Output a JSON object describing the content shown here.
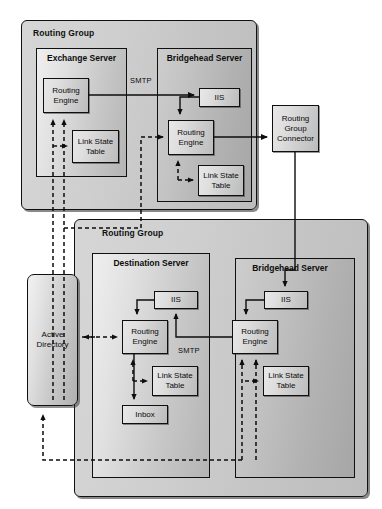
{
  "diagram": {
    "type": "network-architecture",
    "groups": [
      {
        "id": "routing-group-top",
        "label": "Routing Group",
        "servers": [
          {
            "id": "exchange-server",
            "label_line1": "Exchange",
            "label_line2": "Server",
            "components": [
              {
                "id": "ex-routing-engine",
                "label_line1": "Routing",
                "label_line2": "Engine"
              },
              {
                "id": "ex-link-state-table",
                "label_line1": "Link State",
                "label_line2": "Table"
              }
            ]
          },
          {
            "id": "bridgehead-server-top",
            "label_line1": "Bridgehead",
            "label_line2": "Server",
            "components": [
              {
                "id": "bh-top-iis",
                "label_line1": "IIS",
                "label_line2": ""
              },
              {
                "id": "bh-top-routing-engine",
                "label_line1": "Routing",
                "label_line2": "Engine"
              },
              {
                "id": "bh-top-link-state-table",
                "label_line1": "Link State",
                "label_line2": "Table"
              }
            ]
          }
        ]
      },
      {
        "id": "routing-group-bottom",
        "label": "Routing Group",
        "servers": [
          {
            "id": "destination-server",
            "label_line1": "Destination",
            "label_line2": "Server",
            "components": [
              {
                "id": "dest-iis",
                "label_line1": "IIS",
                "label_line2": ""
              },
              {
                "id": "dest-routing-engine",
                "label_line1": "Routing",
                "label_line2": "Engine"
              },
              {
                "id": "dest-link-state-table",
                "label_line1": "Link State",
                "label_line2": "Table"
              },
              {
                "id": "dest-inbox",
                "label_line1": "Inbox",
                "label_line2": ""
              }
            ]
          },
          {
            "id": "bridgehead-server-bottom",
            "label_line1": "Bridgehead",
            "label_line2": "Server",
            "components": [
              {
                "id": "bh-bot-iis",
                "label_line1": "IIS",
                "label_line2": ""
              },
              {
                "id": "bh-bot-routing-engine",
                "label_line1": "Routing",
                "label_line2": "Engine"
              },
              {
                "id": "bh-bot-link-state-table",
                "label_line1": "Link State",
                "label_line2": "Table"
              }
            ]
          }
        ]
      }
    ],
    "standalone": [
      {
        "id": "routing-group-connector",
        "label_line1": "Routing",
        "label_line2": "Group",
        "label_line3": "Connector"
      },
      {
        "id": "active-directory",
        "label_line1": "Active",
        "label_line2": "Directory"
      }
    ],
    "connection_labels": [
      {
        "id": "smtp-top",
        "text": "SMTP"
      },
      {
        "id": "smtp-bottom",
        "text": "SMTP"
      }
    ],
    "legend": {
      "solid_line_meaning": "SMTP message flow",
      "dashed_line_meaning": "Link state / directory lookup"
    },
    "colors": {
      "stroke": "#101010",
      "group_fill_start": "#d6d6d6",
      "group_fill_end": "#bdbdbd",
      "server_fill_start": "#efefef",
      "server_fill_end": "#b4b4b4",
      "component_fill_start": "#e8e8e8",
      "component_fill_end": "#bcbcbc",
      "background": "#ffffff"
    }
  }
}
